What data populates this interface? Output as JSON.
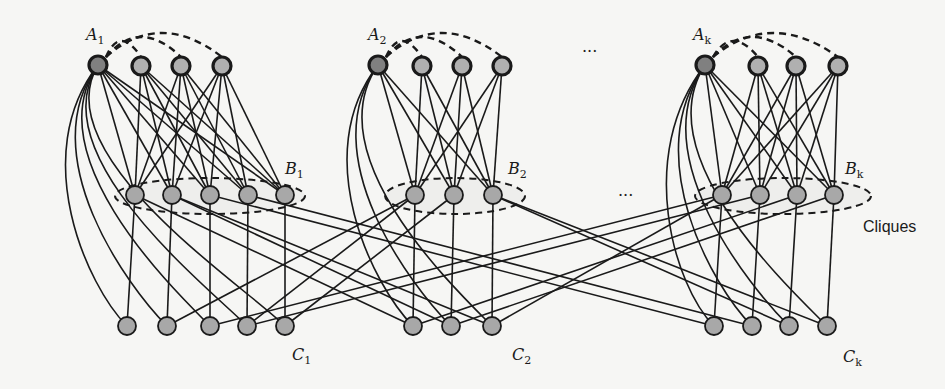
{
  "figure": {
    "type": "graph-diagram",
    "node_colors": {
      "top_first": "#808080",
      "top_other": "#b0b0b0",
      "regular": "#a8a8a8",
      "edge": "#1a1a1a"
    },
    "groups": [
      {
        "name": "group-1",
        "top_label": "A",
        "top_sub": "1",
        "mid_label": "B",
        "mid_sub": "1",
        "bot_label": "C",
        "bot_sub": "1",
        "top_nodes": [
          [
            98,
            65
          ],
          [
            141,
            66
          ],
          [
            181,
            66
          ],
          [
            222,
            66
          ]
        ],
        "mid_nodes": [
          [
            135,
            195
          ],
          [
            172,
            195
          ],
          [
            210,
            195
          ],
          [
            248,
            195
          ],
          [
            285,
            195
          ]
        ],
        "bot_nodes": [
          [
            127,
            326
          ],
          [
            167,
            326
          ],
          [
            210,
            326
          ],
          [
            247,
            326
          ],
          [
            285,
            326
          ]
        ],
        "ellipse": {
          "cx": 210,
          "cy": 196,
          "rx": 95,
          "ry": 18
        },
        "top_label_pos": [
          86,
          40
        ],
        "mid_label_pos": [
          285,
          174
        ],
        "bot_label_pos": [
          292,
          360
        ]
      },
      {
        "name": "group-2",
        "top_label": "A",
        "top_sub": "2",
        "mid_label": "B",
        "mid_sub": "2",
        "bot_label": "C",
        "bot_sub": "2",
        "top_nodes": [
          [
            378,
            65
          ],
          [
            422,
            66
          ],
          [
            462,
            66
          ],
          [
            502,
            66
          ]
        ],
        "mid_nodes": [
          [
            415,
            195
          ],
          [
            454,
            195
          ],
          [
            493,
            195
          ]
        ],
        "bot_nodes": [
          [
            413,
            326
          ],
          [
            451,
            326
          ],
          [
            492,
            326
          ]
        ],
        "ellipse": {
          "cx": 455,
          "cy": 196,
          "rx": 70,
          "ry": 18
        },
        "top_label_pos": [
          368,
          40
        ],
        "mid_label_pos": [
          508,
          174
        ],
        "bot_label_pos": [
          512,
          360
        ]
      },
      {
        "name": "group-k",
        "top_label": "A",
        "top_sub": "k",
        "mid_label": "B",
        "mid_sub": "k",
        "bot_label": "C",
        "bot_sub": "k",
        "top_nodes": [
          [
            705,
            65
          ],
          [
            758,
            66
          ],
          [
            796,
            66
          ],
          [
            838,
            66
          ]
        ],
        "mid_nodes": [
          [
            722,
            195
          ],
          [
            760,
            195
          ],
          [
            797,
            195
          ],
          [
            834,
            195
          ]
        ],
        "bot_nodes": [
          [
            714,
            326
          ],
          [
            752,
            326
          ],
          [
            789,
            326
          ],
          [
            827,
            326
          ]
        ],
        "ellipse": {
          "cx": 783,
          "cy": 196,
          "rx": 88,
          "ry": 18
        },
        "top_label_pos": [
          693,
          40
        ],
        "mid_label_pos": [
          845,
          174
        ],
        "bot_label_pos": [
          843,
          362
        ]
      }
    ],
    "ellipsis_top": "...",
    "ellipsis_mid": "...",
    "ellipsis_top_pos": [
      582,
      52
    ],
    "ellipsis_mid_pos": [
      618,
      196
    ],
    "cliques_label": "Cliques",
    "cliques_label_pos": [
      863,
      232
    ],
    "cross_edges": [
      [
        [
          135,
          195
        ],
        [
          413,
          326
        ]
      ],
      [
        [
          172,
          195
        ],
        [
          451,
          326
        ]
      ],
      [
        [
          172,
          195
        ],
        [
          492,
          326
        ]
      ],
      [
        [
          210,
          195
        ],
        [
          714,
          326
        ]
      ],
      [
        [
          248,
          195
        ],
        [
          752,
          326
        ]
      ],
      [
        [
          415,
          195
        ],
        [
          167,
          326
        ]
      ],
      [
        [
          415,
          195
        ],
        [
          247,
          326
        ]
      ],
      [
        [
          454,
          195
        ],
        [
          285,
          326
        ]
      ],
      [
        [
          493,
          195
        ],
        [
          789,
          326
        ]
      ],
      [
        [
          493,
          195
        ],
        [
          827,
          326
        ]
      ],
      [
        [
          722,
          195
        ],
        [
          210,
          326
        ]
      ],
      [
        [
          760,
          195
        ],
        [
          247,
          326
        ]
      ],
      [
        [
          797,
          195
        ],
        [
          413,
          326
        ]
      ],
      [
        [
          834,
          195
        ],
        [
          451,
          326
        ]
      ],
      [
        [
          722,
          195
        ],
        [
          492,
          326
        ]
      ]
    ]
  }
}
